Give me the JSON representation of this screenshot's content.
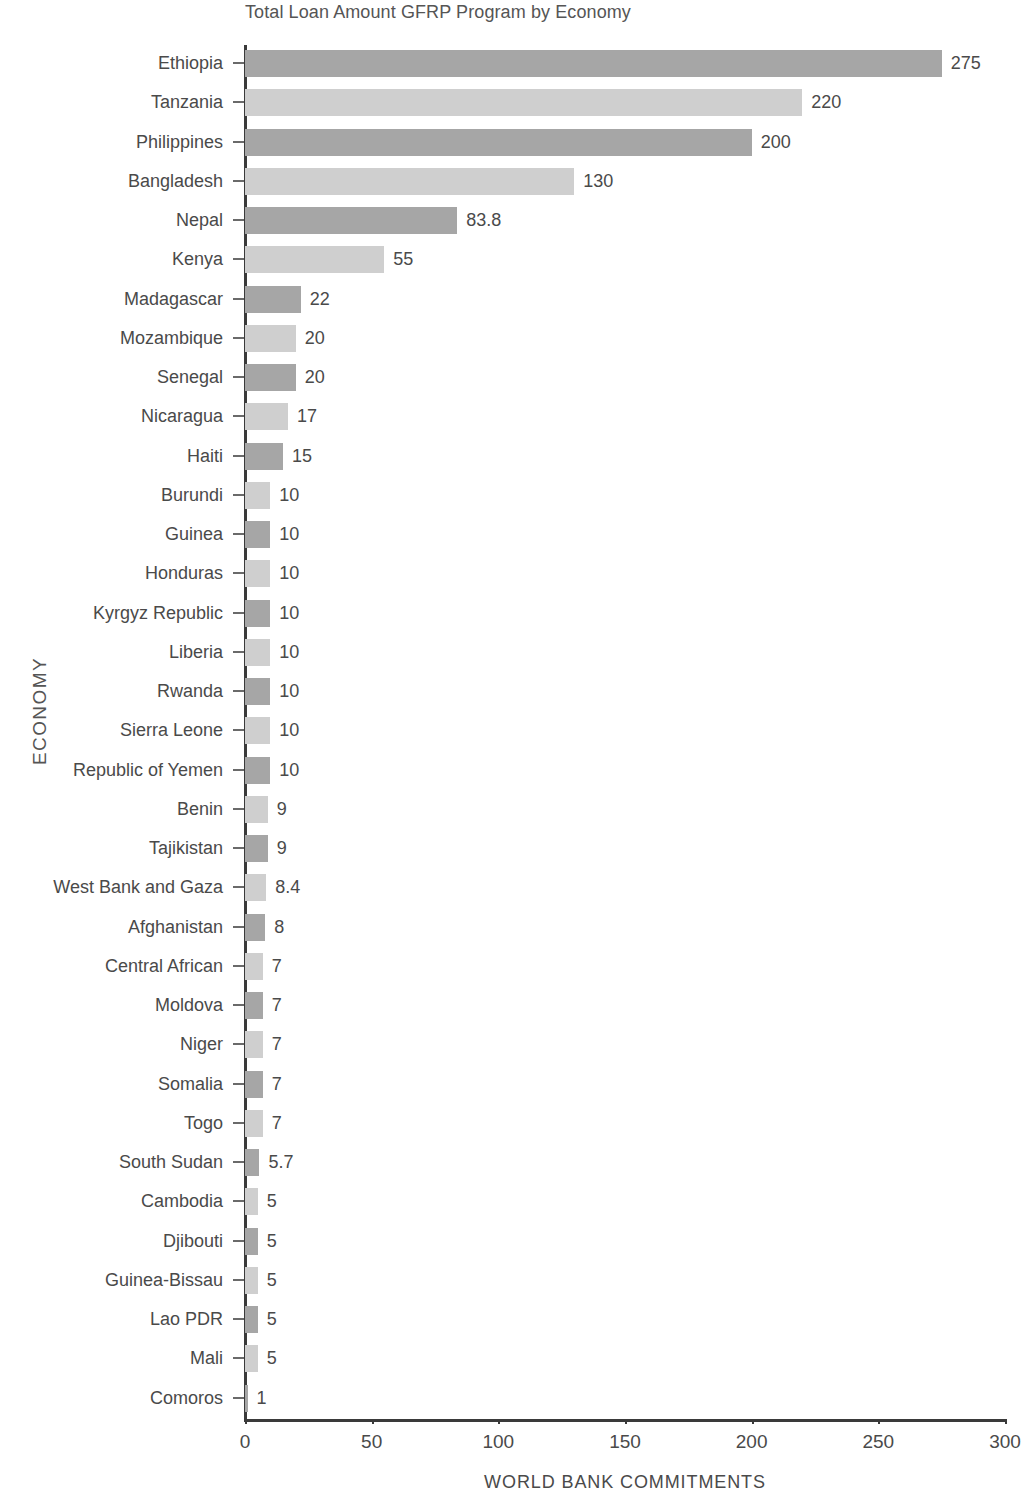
{
  "chart_data": {
    "type": "bar",
    "orientation": "horizontal",
    "title": "Total Loan Amount GFRP Program by Economy",
    "xlabel": "WORLD BANK COMMITMENTS",
    "ylabel": "ECONOMY",
    "xlim": [
      0,
      300
    ],
    "xticks": [
      0,
      50,
      100,
      150,
      200,
      250,
      300
    ],
    "xtick_labels": [
      "0",
      "50",
      "100",
      "150",
      "200",
      "250",
      "300"
    ],
    "grid": false,
    "legend": null,
    "bar_colors": [
      "#a6a6a6",
      "#cfcfcf"
    ],
    "categories": [
      "Ethiopia",
      "Tanzania",
      "Philippines",
      "Bangladesh",
      "Nepal",
      "Kenya",
      "Madagascar",
      "Mozambique",
      "Senegal",
      "Nicaragua",
      "Haiti",
      "Burundi",
      "Guinea",
      "Honduras",
      "Kyrgyz Republic",
      "Liberia",
      "Rwanda",
      "Sierra Leone",
      "Republic of Yemen",
      "Benin",
      "Tajikistan",
      "West Bank and Gaza",
      "Afghanistan",
      "Central African",
      "Moldova",
      "Niger",
      "Somalia",
      "Togo",
      "South Sudan",
      "Cambodia",
      "Djibouti",
      "Guinea-Bissau",
      "Lao PDR",
      "Mali",
      "Comoros"
    ],
    "values": [
      275,
      220,
      200,
      130,
      83.8,
      55,
      22,
      20,
      20,
      17,
      15,
      10,
      10,
      10,
      10,
      10,
      10,
      10,
      10,
      9,
      9,
      8.4,
      8,
      7,
      7,
      7,
      7,
      7,
      5.7,
      5,
      5,
      5,
      5,
      5,
      1
    ],
    "value_labels": [
      "275",
      "220",
      "200",
      "130",
      "83.8",
      "55",
      "22",
      "20",
      "20",
      "17",
      "15",
      "10",
      "10",
      "10",
      "10",
      "10",
      "10",
      "10",
      "10",
      "9",
      "9",
      "8.4",
      "8",
      "7",
      "7",
      "7",
      "7",
      "7",
      "5.7",
      "5",
      "5",
      "5",
      "5",
      "5",
      "1"
    ]
  }
}
